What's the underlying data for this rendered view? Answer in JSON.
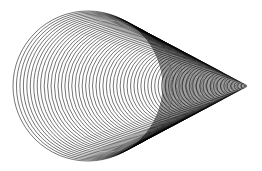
{
  "figure": {
    "width": 262,
    "height": 171,
    "background": "#ffffff",
    "stroke_color": "#000000",
    "stroke_width": 0.55,
    "circles": {
      "count": 68,
      "largest": {
        "cx": 88,
        "cy": 86,
        "r": 75
      },
      "tip": {
        "x": 248,
        "y": 86
      },
      "radius_ratio_to_tip_distance": 0.469
    }
  }
}
